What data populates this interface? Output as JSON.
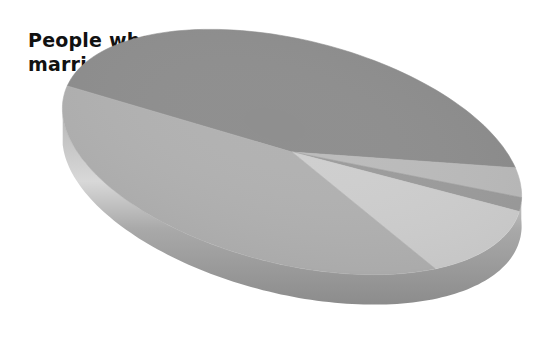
{
  "chart_data": {
    "type": "pie",
    "style": "3d-tilted",
    "title": "People who are married",
    "title_lines": [
      "People who are",
      "married"
    ],
    "legend": "none",
    "data_labels": "none",
    "slices": [
      {
        "name": "Slice A (dark gray, upper)",
        "value": 43,
        "color": "#8f8f8f"
      },
      {
        "name": "Slice B (light gray, thin)",
        "value": 4,
        "color": "#bcbcbc"
      },
      {
        "name": "Slice C (medium gray, thin)",
        "value": 2,
        "color": "#9d9d9d"
      },
      {
        "name": "Slice D (lightest gray)",
        "value": 12,
        "color": "#cfcfcf"
      },
      {
        "name": "Slice E (mid gray, lower)",
        "value": 39,
        "color": "#b2b2b2"
      }
    ],
    "start_angle_deg": 175,
    "direction": "clockwise"
  },
  "colors": {
    "rim": "#a8a8a8",
    "rim_dark": "#8a8a8a",
    "rim_highlight": "#d6d6d6",
    "title": "#111111"
  }
}
